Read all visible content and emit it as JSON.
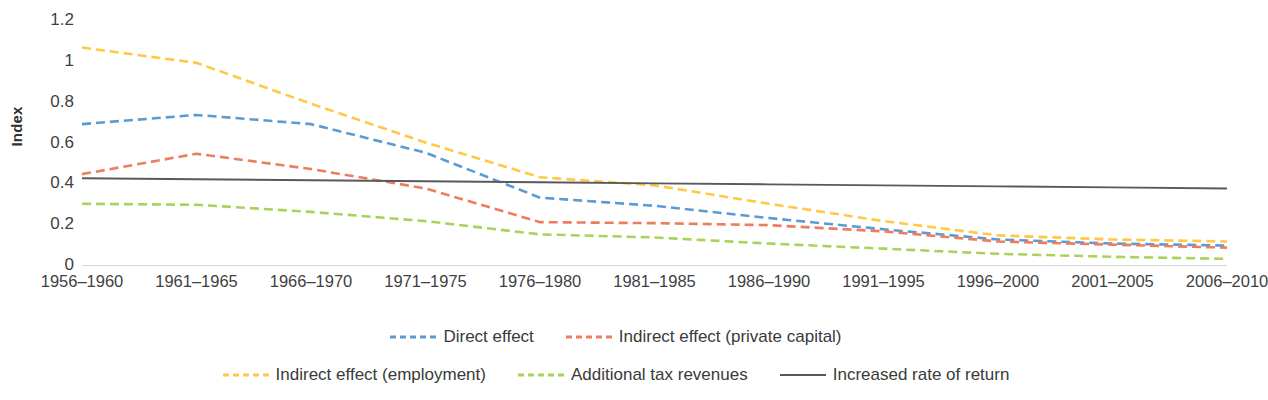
{
  "chart_data": {
    "type": "line",
    "title": "",
    "xlabel": "",
    "ylabel": "Index",
    "ylim": [
      0,
      1.2
    ],
    "ytick_labels": [
      "1.2",
      "1",
      "0.8",
      "0.6",
      "0.4",
      "0.2",
      "0"
    ],
    "ytick_values": [
      1.2,
      1,
      0.8,
      0.6,
      0.4,
      0.2,
      0
    ],
    "grid": false,
    "legend_position": "bottom",
    "categories": [
      "1956–1960",
      "1961–1965",
      "1966–1970",
      "1971–1975",
      "1976–1980",
      "1981–1985",
      "1986–1990",
      "1991–1995",
      "1996–2000",
      "2001–2005",
      "2006–2010"
    ],
    "series": [
      {
        "name": "Direct effect",
        "color": "#5B9BD5",
        "style": "dashed",
        "values": [
          0.69,
          0.735,
          0.69,
          0.55,
          0.33,
          0.29,
          0.23,
          0.175,
          0.125,
          0.105,
          0.095
        ]
      },
      {
        "name": "Indirect effect (private capital)",
        "color": "#ED7D5F",
        "style": "dashed",
        "values": [
          0.445,
          0.545,
          0.47,
          0.375,
          0.21,
          0.205,
          0.195,
          0.165,
          0.115,
          0.1,
          0.085
        ]
      },
      {
        "name": "Indirect effect (employment)",
        "color": "#FFC845",
        "style": "dashed",
        "values": [
          1.065,
          0.99,
          0.79,
          0.6,
          0.43,
          0.39,
          0.3,
          0.215,
          0.145,
          0.125,
          0.115
        ]
      },
      {
        "name": "Additional tax revenues",
        "color": "#A9D358",
        "style": "dashed",
        "values": [
          0.3,
          0.295,
          0.26,
          0.215,
          0.15,
          0.135,
          0.105,
          0.08,
          0.055,
          0.04,
          0.03
        ]
      },
      {
        "name": "Increased rate of return",
        "color": "#595959",
        "style": "solid",
        "values": [
          0.425,
          0.42,
          0.415,
          0.41,
          0.405,
          0.4,
          0.395,
          0.39,
          0.385,
          0.38,
          0.375
        ]
      }
    ]
  }
}
